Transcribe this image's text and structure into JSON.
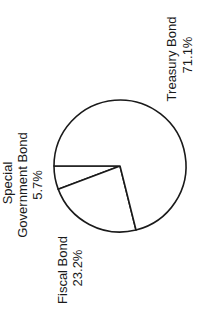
{
  "chart_data": {
    "type": "pie",
    "title": "",
    "orientation": "rotated -90 degrees (text reads bottom-to-top)",
    "categories": [
      "Treasury Bond",
      "Fiscal Bond",
      "Special Government Bond"
    ],
    "values": [
      71.1,
      23.2,
      5.7
    ],
    "unit": "%",
    "labels": [
      {
        "name": "Treasury Bond",
        "value_label": "71.1%"
      },
      {
        "name": "Fiscal Bond",
        "value_label": "23.2%"
      },
      {
        "name": "Special Government Bond",
        "name_line1": "Special",
        "name_line2": "Government Bond",
        "value_label": "5.7%"
      }
    ],
    "legend": "none (direct labels)",
    "fill": "#ffffff",
    "stroke": "#1a1a1a"
  },
  "labels": {
    "treasury_name": "Treasury Bond",
    "treasury_value": "71.1%",
    "fiscal_name": "Fiscal Bond",
    "fiscal_value": "23.2%",
    "special_line1": "Special",
    "special_line2": "Government Bond",
    "special_value": "5.7%"
  }
}
